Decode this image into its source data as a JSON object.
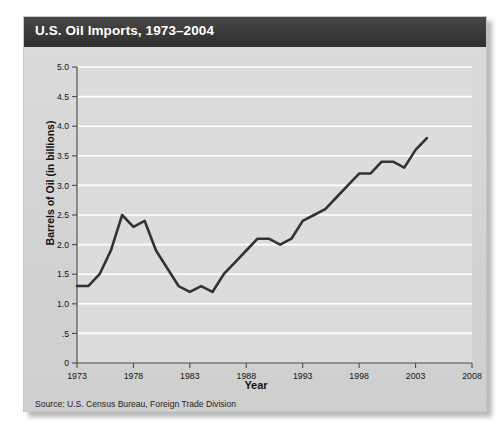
{
  "figure": {
    "title": "U.S. Oil Imports, 1973–2004",
    "source": "Source:  U.S. Census Bureau, Foreign Trade Division"
  },
  "chart_data": {
    "type": "line",
    "title": "U.S. Oil Imports, 1973–2004",
    "xlabel": "Year",
    "ylabel": "Barrels of Oil (in billions)",
    "xlim": [
      1973,
      2008
    ],
    "ylim": [
      0,
      5.0
    ],
    "grid": true,
    "legend": "none",
    "xticks": [
      "1973",
      "1978",
      "1983",
      "1988",
      "1993",
      "1998",
      "2003",
      "2008"
    ],
    "xtick_values": [
      1973,
      1978,
      1983,
      1988,
      1993,
      1998,
      2003,
      2008
    ],
    "yticks": [
      "0",
      ".5",
      "1.0",
      "1.5",
      "2.0",
      "2.5",
      "3.0",
      "3.5",
      "4.0",
      "4.5",
      "5.0"
    ],
    "ytick_values": [
      0,
      0.5,
      1.0,
      1.5,
      2.0,
      2.5,
      3.0,
      3.5,
      4.0,
      4.5,
      5.0
    ],
    "series": [
      {
        "name": "Barrels of Oil Imported",
        "x": [
          1973,
          1974,
          1975,
          1976,
          1977,
          1978,
          1979,
          1980,
          1981,
          1982,
          1983,
          1984,
          1985,
          1986,
          1987,
          1988,
          1989,
          1990,
          1991,
          1992,
          1993,
          1994,
          1995,
          1996,
          1997,
          1998,
          1999,
          2000,
          2001,
          2002,
          2003,
          2004
        ],
        "values": [
          1.3,
          1.3,
          1.5,
          1.9,
          2.5,
          2.3,
          2.4,
          1.9,
          1.6,
          1.3,
          1.2,
          1.3,
          1.2,
          1.5,
          1.7,
          1.9,
          2.1,
          2.1,
          2.0,
          2.1,
          2.4,
          2.5,
          2.6,
          2.8,
          3.0,
          3.2,
          3.2,
          3.4,
          3.4,
          3.3,
          3.6,
          3.8
        ]
      }
    ]
  }
}
